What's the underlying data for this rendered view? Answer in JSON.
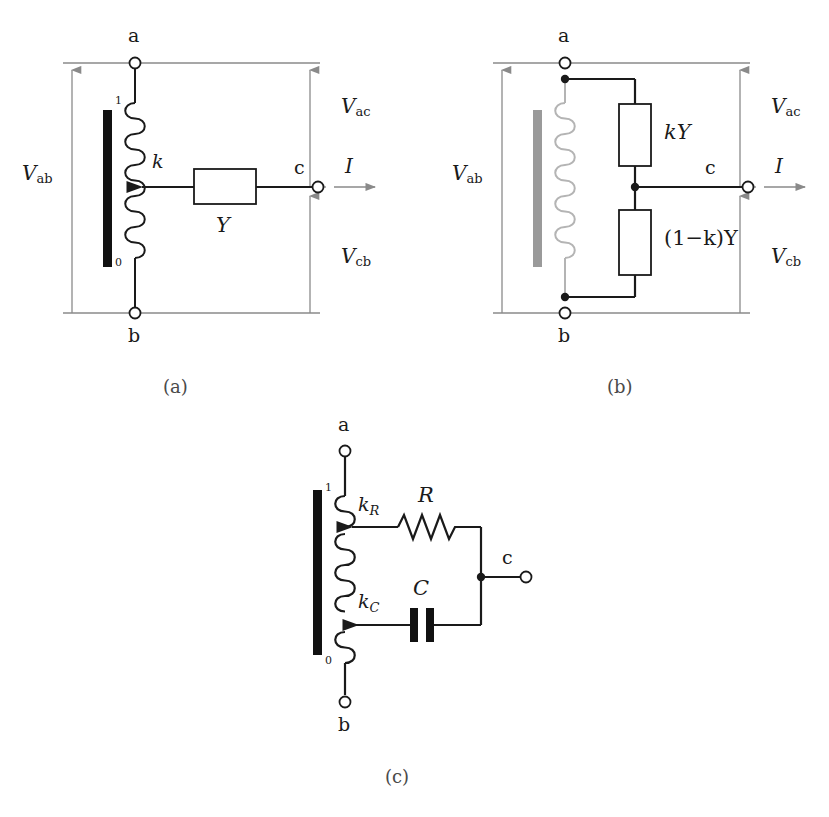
{
  "figure": {
    "background_color": "#ffffff",
    "ink_color": "#1a1a1a",
    "faint_color": "#8a8a8a",
    "core_black": "#111111",
    "core_gray": "#9a9a9a",
    "coil_gray": "#b4b4b4"
  },
  "captions": {
    "a": "(a)",
    "b": "(b)",
    "c": "(c)"
  },
  "panel_a": {
    "name": "tapped-inductor-with-admittance",
    "terminal_a": "a",
    "terminal_b": "b",
    "terminal_c": "c",
    "tap_top": "1",
    "tap_bottom": "0",
    "tap_ratio": "k",
    "component": "Y",
    "v_ab": "V",
    "v_ab_sub": "ab",
    "v_ac": "V",
    "v_ac_sub": "ac",
    "v_cb": "V",
    "v_cb_sub": "cb",
    "current": "I"
  },
  "panel_b": {
    "name": "equivalent-pi-network",
    "terminal_a": "a",
    "terminal_b": "b",
    "terminal_c": "c",
    "component_top": "kY",
    "component_top_coef": "k",
    "component_top_base": "Y",
    "component_bottom": "(1−k)Y",
    "v_ab": "V",
    "v_ab_sub": "ab",
    "v_ac": "V",
    "v_ac_sub": "ac",
    "v_cb": "V",
    "v_cb_sub": "cb",
    "current": "I"
  },
  "panel_c": {
    "name": "dual-tap-rc-network",
    "terminal_a": "a",
    "terminal_b": "b",
    "terminal_c": "c",
    "tap_top": "1",
    "tap_bottom": "0",
    "tap_r": "k",
    "tap_r_sub": "R",
    "tap_c": "k",
    "tap_c_sub": "C",
    "resistor": "R",
    "capacitor": "C"
  }
}
